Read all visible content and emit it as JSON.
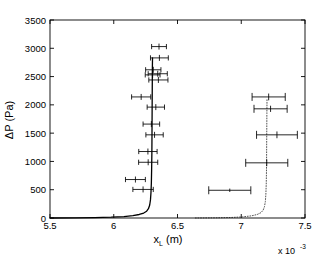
{
  "chart_data": {
    "type": "scatter",
    "title": "",
    "xlabel": "x_L (m)",
    "ylabel": "ΔP (Pa)",
    "x_multiplier": "x 10",
    "x_multiplier_exp": "-3",
    "xlim": [
      0.0055,
      0.0075
    ],
    "ylim": [
      0,
      3500
    ],
    "xticks": [
      0.0055,
      0.006,
      0.0065,
      0.007,
      0.0075
    ],
    "xticklabels": [
      "5.5",
      "6",
      "6.5",
      "7",
      "7.5"
    ],
    "yticks": [
      0,
      500,
      1000,
      1500,
      2000,
      2500,
      3000,
      3500
    ],
    "yticklabels": [
      "0",
      "500",
      "1000",
      "1500",
      "2000",
      "2500",
      "3000",
      "3500"
    ],
    "grid": false,
    "legend": "none",
    "series": [
      {
        "name": "model-curve-solid",
        "kind": "line",
        "style": "solid",
        "color": "#000000",
        "points": [
          [
            0.0055,
            0
          ],
          [
            0.0057,
            2
          ],
          [
            0.00585,
            6
          ],
          [
            0.00598,
            14
          ],
          [
            0.00608,
            26
          ],
          [
            0.00615,
            42
          ],
          [
            0.0062,
            62
          ],
          [
            0.006235,
            88
          ],
          [
            0.006258,
            120
          ],
          [
            0.006272,
            165
          ],
          [
            0.006282,
            230
          ],
          [
            0.006288,
            320
          ],
          [
            0.006292,
            450
          ],
          [
            0.006295,
            620
          ],
          [
            0.006297,
            850
          ],
          [
            0.006299,
            1150
          ],
          [
            0.0063,
            1500
          ],
          [
            0.006301,
            1900
          ],
          [
            0.006302,
            2300
          ],
          [
            0.006303,
            2650
          ],
          [
            0.006304,
            2830
          ]
        ]
      },
      {
        "name": "model-curve-dotted",
        "kind": "line",
        "style": "dotted",
        "color": "#555555",
        "points": [
          [
            0.00664,
            0
          ],
          [
            0.0068,
            3
          ],
          [
            0.00692,
            9
          ],
          [
            0.00701,
            20
          ],
          [
            0.00708,
            38
          ],
          [
            0.007125,
            62
          ],
          [
            0.007155,
            95
          ],
          [
            0.007172,
            140
          ],
          [
            0.007182,
            200
          ],
          [
            0.007189,
            290
          ],
          [
            0.007193,
            420
          ],
          [
            0.007196,
            600
          ],
          [
            0.007198,
            850
          ],
          [
            0.007199,
            1150
          ],
          [
            0.0072,
            1500
          ],
          [
            0.007201,
            1850
          ],
          [
            0.007202,
            2100
          ]
        ]
      }
    ],
    "errorbar_points": [
      {
        "set": "left",
        "x": 0.006355,
        "y": 3030,
        "xerr": 5.8e-05,
        "yerr": 0
      },
      {
        "set": "left",
        "x": 0.006358,
        "y": 2830,
        "xerr": 7e-05,
        "yerr": 0
      },
      {
        "set": "left",
        "x": 0.00631,
        "y": 2620,
        "xerr": 6e-05,
        "yerr": 0
      },
      {
        "set": "left",
        "x": 0.006345,
        "y": 2550,
        "xerr": 7.5e-05,
        "yerr": 0
      },
      {
        "set": "left",
        "x": 0.006305,
        "y": 2530,
        "xerr": 5.8e-05,
        "yerr": 0
      },
      {
        "set": "left",
        "x": 0.00635,
        "y": 2440,
        "xerr": 7.5e-05,
        "yerr": 0
      },
      {
        "set": "left",
        "x": 0.006215,
        "y": 2140,
        "xerr": 7.5e-05,
        "yerr": 0
      },
      {
        "set": "left",
        "x": 0.00633,
        "y": 1960,
        "xerr": 6.8e-05,
        "yerr": 0
      },
      {
        "set": "left",
        "x": 0.006295,
        "y": 1660,
        "xerr": 6.5e-05,
        "yerr": 0
      },
      {
        "set": "left",
        "x": 0.00632,
        "y": 1470,
        "xerr": 6.8e-05,
        "yerr": 0
      },
      {
        "set": "left",
        "x": 0.006268,
        "y": 1175,
        "xerr": 7.2e-05,
        "yerr": 0
      },
      {
        "set": "left",
        "x": 0.00627,
        "y": 985,
        "xerr": 7.5e-05,
        "yerr": 0
      },
      {
        "set": "left",
        "x": 0.00617,
        "y": 680,
        "xerr": 7.8e-05,
        "yerr": 0
      },
      {
        "set": "left",
        "x": 0.00623,
        "y": 505,
        "xerr": 8e-05,
        "yerr": 0
      },
      {
        "set": "right",
        "x": 0.007215,
        "y": 2140,
        "xerr": 0.00013,
        "yerr": 60
      },
      {
        "set": "right",
        "x": 0.00723,
        "y": 1930,
        "xerr": 0.00013,
        "yerr": 55
      },
      {
        "set": "right",
        "x": 0.00728,
        "y": 1470,
        "xerr": 0.00016,
        "yerr": 60
      },
      {
        "set": "right",
        "x": 0.0072,
        "y": 975,
        "xerr": 0.000165,
        "yerr": 60
      },
      {
        "set": "right",
        "x": 0.00691,
        "y": 490,
        "xerr": 0.000165,
        "yerr": 30
      }
    ]
  },
  "figure": {
    "background_color": "#ffffff",
    "axis_color": "#000000",
    "data_color": "#000000",
    "dotted_color": "#555555"
  }
}
